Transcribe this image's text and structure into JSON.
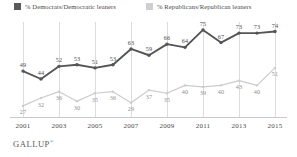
{
  "brand": {
    "name": "GALLUP",
    "mark": "®"
  },
  "legend": {
    "position": "top",
    "items": [
      {
        "label": "% Democrats/Democratic leaners",
        "color": "#5a5a5a",
        "key": "democrats"
      },
      {
        "label": "% Republicans/Republican leaners",
        "color": "#cfcfcf",
        "key": "republicans"
      }
    ]
  },
  "chart_data": {
    "type": "line",
    "title": "",
    "subtitle": "",
    "xlabel": "",
    "ylabel": "",
    "grid": true,
    "grid_axis": "x",
    "legend_position": "top",
    "ylim": [
      20,
      80
    ],
    "x": [
      2001,
      2002,
      2003,
      2004,
      2005,
      2006,
      2007,
      2008,
      2009,
      2010,
      2011,
      2012,
      2013,
      2014,
      2015
    ],
    "xticks": [
      "2001",
      "2003",
      "2005",
      "2007",
      "2009",
      "2011",
      "2013",
      "2015"
    ],
    "xtick_values": [
      2001,
      2003,
      2005,
      2007,
      2009,
      2011,
      2013,
      2015
    ],
    "series": [
      {
        "name": "% Democrats/Democratic leaners",
        "color": "#555555",
        "marker": "circle",
        "values": [
          49,
          44,
          52,
          53,
          51,
          53,
          63,
          59,
          66,
          64,
          75,
          67,
          73,
          73,
          74
        ]
      },
      {
        "name": "% Republicans/Republican leaners",
        "color": "#cccccc",
        "marker": "circle",
        "values": [
          27,
          32,
          36,
          30,
          35,
          36,
          29,
          37,
          35,
          40,
          39,
          40,
          43,
          40,
          51
        ]
      }
    ]
  }
}
